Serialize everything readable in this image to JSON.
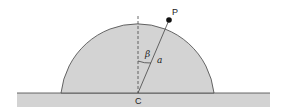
{
  "diagram": {
    "labels": {
      "point_p": "P",
      "center_c": "C",
      "angle": "β",
      "radius": "a"
    },
    "colors": {
      "fill": "#d3d3d3",
      "stroke": "#444444",
      "point": "#111111"
    },
    "angle_beta_deg": 24
  }
}
